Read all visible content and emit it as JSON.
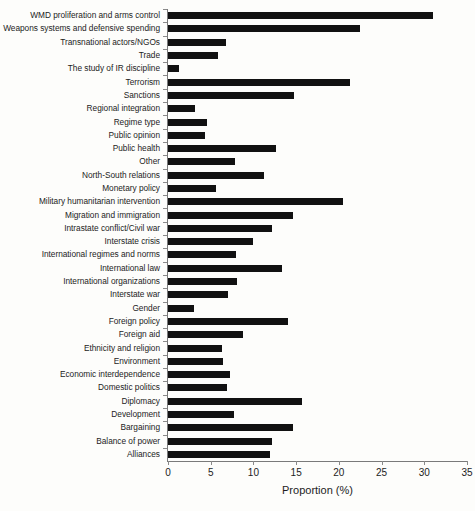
{
  "chart_data": {
    "type": "bar",
    "orientation": "horizontal",
    "title": "",
    "xlabel": "Proportion (%)",
    "ylabel": "",
    "xlim": [
      0,
      35
    ],
    "xticks": [
      0,
      5,
      10,
      15,
      20,
      25,
      30,
      35
    ],
    "xtick_labels": [
      "0",
      "5",
      "10",
      "15",
      "20",
      "25",
      "30",
      "35"
    ],
    "grid": false,
    "legend": false,
    "bar_color": "#111111",
    "axis_color": "#7a7a7a",
    "categories": [
      "WMD proliferation and arms control",
      "Weapons systems and defensive spending",
      "Transnational actors/NGOs",
      "Trade",
      "The study of IR discipline",
      "Terrorism",
      "Sanctions",
      "Regional integration",
      "Regime type",
      "Public opinion",
      "Public health",
      "Other",
      "North-South relations",
      "Monetary policy",
      "Military humanitarian intervention",
      "Migration and immigration",
      "Intrastate conflict/Civil war",
      "Interstate crisis",
      "International regimes and norms",
      "International law",
      "International organizations",
      "Interstate war",
      "Gender",
      "Foreign policy",
      "Foreign aid",
      "Ethnicity and religion",
      "Environment",
      "Economic interdependence",
      "Domestic politics",
      "Diplomacy",
      "Development",
      "Bargaining",
      "Balance of power",
      "Alliances"
    ],
    "values": [
      31.0,
      22.5,
      6.8,
      5.9,
      1.3,
      21.3,
      14.8,
      3.2,
      4.6,
      4.3,
      12.6,
      7.8,
      11.2,
      5.6,
      20.5,
      14.6,
      12.2,
      10.0,
      8.0,
      13.3,
      8.1,
      7.0,
      3.0,
      14.1,
      8.8,
      6.3,
      6.4,
      7.2,
      6.9,
      15.7,
      7.7,
      14.6,
      12.2,
      11.9
    ]
  }
}
